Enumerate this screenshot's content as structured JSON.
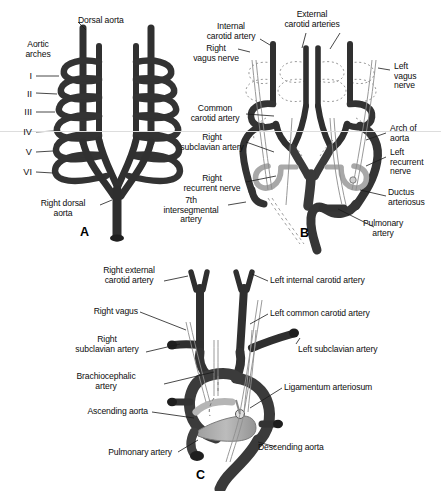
{
  "figure": {
    "background_color": "#ffffff",
    "vessel_dark": "#3a3a3a",
    "vessel_mid": "#555555",
    "vessel_light": "#b0b0b0",
    "nerve_color": "#7a7a7a",
    "outline_color": "#111111"
  },
  "panels": [
    {
      "id": "A",
      "letter": "A"
    },
    {
      "id": "B",
      "letter": "B"
    },
    {
      "id": "C",
      "letter": "C"
    }
  ],
  "panel_a": {
    "letter": "A",
    "labels": {
      "dorsal_aorta": "Dorsal aorta",
      "aortic_arches": "Aortic\narches",
      "right_dorsal_aorta": "Right dorsal\naorta"
    },
    "arch_numerals": [
      "I",
      "II",
      "III",
      "IV",
      "V",
      "VI"
    ]
  },
  "panel_b": {
    "letter": "B",
    "labels": {
      "internal_carotid_artery": "Internal\ncarotid artery",
      "external_carotid_arteries": "External\ncarotid arteries",
      "right_vagus_nerve": "Right\nvagus nerve",
      "left_vagus_nerve": "Left\nvagus\nnerve",
      "common_carotid_artery": "Common\ncarotid artery",
      "arch_of_aorta": "Arch of\naorta",
      "right_subclavian_artery": "Right\nsubclavian artery",
      "left_recurrent_nerve": "Left\nrecurrent\nnerve",
      "right_recurrent_nerve": "Right\nrecurrent nerve",
      "ductus_arteriosus": "Ductus\narteriosus",
      "seventh_intersegmental_artery": "7th\nintersegmental\nartery",
      "pulmonary_artery": "Pulmonary\nartery"
    }
  },
  "panel_c": {
    "letter": "C",
    "labels": {
      "right_external_carotid_artery": "Right external\ncarotid artery",
      "left_internal_carotid_artery": "Left internal carotid artery",
      "right_vagus": "Right vagus",
      "left_common_carotid_artery": "Left common carotid artery",
      "right_subclavian_artery": "Right\nsubclavian artery",
      "left_subclavian_artery": "Left subclavian artery",
      "brachiocephalic_artery": "Brachiocephalic\nartery",
      "ligamentum_arteriosum": "Ligamentum arteriosum",
      "ascending_aorta": "Ascending aorta",
      "descending_aorta": "Descending aorta",
      "pulmonary_artery": "Pulmonary artery"
    }
  }
}
